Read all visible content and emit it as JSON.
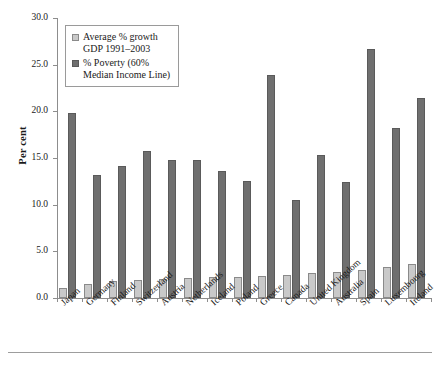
{
  "chart_data": {
    "type": "bar",
    "title": "",
    "xlabel": "",
    "ylabel": "Per cent",
    "ylim": [
      0.0,
      30.0
    ],
    "yticks": [
      "0.0",
      "5.0",
      "10.0",
      "15.0",
      "20.0",
      "25.0",
      "30.0"
    ],
    "ytick_values": [
      0,
      5,
      10,
      15,
      20,
      25,
      30
    ],
    "grid": false,
    "legend_position": "top-left inside plot",
    "categories": [
      "Japan",
      "Germany",
      "Finland",
      "Switzerland",
      "Austria",
      "Netherlands",
      "Iceland",
      "Poland",
      "Greece",
      "Canada",
      "United Kingdom",
      "Australia",
      "Spain",
      "Luxembourg",
      "Ireland"
    ],
    "series": [
      {
        "name": "Average % growth GDP 1991–2003",
        "color": "#c9c9c9",
        "values": [
          1.1,
          1.4,
          1.8,
          1.0,
          1.9,
          2.2,
          2.3,
          2.6,
          2.7,
          2.9,
          3.2,
          3.5,
          3.8,
          5.0,
          7.0
        ]
      },
      {
        "name": "% Poverty (60% Median Income Line)",
        "color": "#6f6f6f",
        "values": [
          19.8,
          13.2,
          14.1,
          15.7,
          14.8,
          14.8,
          13.6,
          12.5,
          23.9,
          10.5,
          15.3,
          12.4,
          26.7,
          18.2,
          21.4
        ]
      }
    ],
    "points": [
      {
        "category": "Japan",
        "growth": 1.1,
        "poverty": 19.8
      },
      {
        "category": "Germany",
        "growth": 1.4,
        "poverty": 13.2
      },
      {
        "category": "Finland",
        "growth": 1.8,
        "poverty": 14.1
      },
      {
        "category": "Switzerland",
        "growth": 1.0,
        "poverty": 12.5
      },
      {
        "category": "Austria",
        "growth": 1.9,
        "poverty": 15.7
      },
      {
        "category": "Netherlands",
        "growth": 2.2,
        "poverty": 14.8
      },
      {
        "category": "Iceland",
        "growth": 2.2,
        "poverty": 14.8
      },
      {
        "category": "Poland",
        "growth": 2.3,
        "poverty": 13.6
      },
      {
        "category": "Greece",
        "growth": 2.3,
        "poverty": 12.5
      },
      {
        "category": "Canada",
        "growth": 2.3,
        "poverty": 23.9
      },
      {
        "category": "United Kingdom",
        "growth": 2.6,
        "poverty": 10.5
      },
      {
        "category": "Australia",
        "growth": 2.7,
        "poverty": 15.3
      },
      {
        "category": "Spain",
        "growth": 2.9,
        "poverty": 12.4
      },
      {
        "category": "Luxembourg",
        "growth": 3.2,
        "poverty": 26.7
      },
      {
        "category": "Ireland",
        "growth": 3.4,
        "poverty": 18.2
      }
    ],
    "bar_pairs": [
      {
        "category": "Japan",
        "growth": 1.1,
        "poverty": 19.8
      },
      {
        "category": "Germany",
        "growth": 1.5,
        "poverty": 13.2
      },
      {
        "category": "Finland",
        "growth": 1.8,
        "poverty": 14.1
      },
      {
        "category": "Switzerland",
        "growth": 1.9,
        "poverty": 15.7
      },
      {
        "category": "Austria",
        "growth": 2.0,
        "poverty": 14.8
      },
      {
        "category": "Netherlands",
        "growth": 2.1,
        "poverty": 14.8
      },
      {
        "category": "Iceland",
        "growth": 2.2,
        "poverty": 13.6
      },
      {
        "category": "Poland",
        "growth": 2.2,
        "poverty": 12.5
      },
      {
        "category": "Greece",
        "growth": 2.4,
        "poverty": 23.9
      },
      {
        "category": "Canada",
        "growth": 2.5,
        "poverty": 10.5
      },
      {
        "category": "United Kingdom",
        "growth": 2.7,
        "poverty": 15.3
      },
      {
        "category": "Australia",
        "growth": 2.8,
        "poverty": 12.4
      },
      {
        "category": "Spain",
        "growth": 3.0,
        "poverty": 26.7
      },
      {
        "category": "Luxembourg",
        "growth": 3.3,
        "poverty": 18.2
      },
      {
        "category": "Ireland",
        "growth": 3.6,
        "poverty": 21.4
      }
    ]
  },
  "legend": {
    "entries": [
      {
        "label": "Average % growth\nGDP 1991–2003",
        "swatch": "growth"
      },
      {
        "label": "% Poverty (60%\nMedian Income Line)",
        "swatch": "poverty"
      }
    ]
  },
  "axis": {
    "y_title": "Per cent"
  }
}
